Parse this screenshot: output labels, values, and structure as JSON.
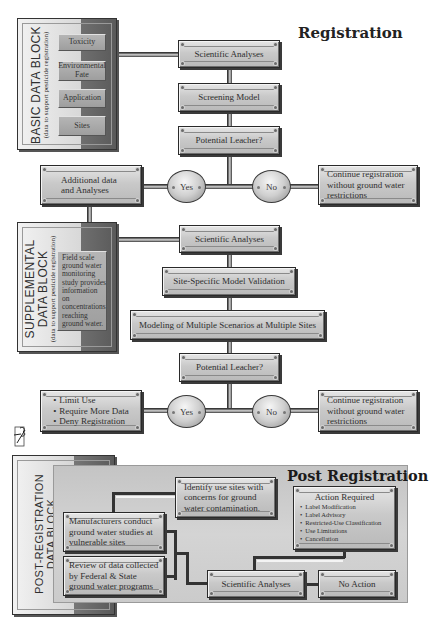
{
  "registration": {
    "title": "Registration",
    "basic_block": {
      "title": "BASIC DATA BLOCK",
      "subtitle": "(data to support pesticide registration)",
      "items": [
        "Toxicity",
        "Environmental Fate",
        "Application",
        "Sites"
      ]
    },
    "flow1": {
      "scientific_analyses": "Scientific Analyses",
      "screening_model": "Screening Model",
      "potential_leacher": "Potential Leacher?",
      "yes": "Yes",
      "no": "No",
      "additional_data": "Additional data and Analyses",
      "continue": "Continue registration without ground water restrictions"
    },
    "supplemental_block": {
      "title_line1": "SUPPLEMENTAL",
      "title_line2": "DATA BLOCK",
      "subtitle": "(data to support pesticide registration)",
      "description": "Field scale ground water monitoring study provides information on concentrations reaching ground water."
    },
    "flow2": {
      "scientific_analyses": "Scientific Analyses",
      "site_specific": "Site-Specific Model Validation",
      "modeling": "Modeling of Multiple Scenarios at Multiple Sites",
      "potential_leacher": "Potential Leacher?",
      "yes": "Yes",
      "no": "No",
      "actions": [
        "Limit Use",
        "Require More Data",
        "Deny Registration"
      ],
      "continue": "Continue registration without ground water restrictions"
    }
  },
  "post_registration": {
    "title": "Post Registration",
    "block_title_line1": "POST-REGISTRATION",
    "block_title_line2": "DATA BLOCK",
    "identify": "Identify use sites with concerns for ground water contamination.",
    "manufacturers": "Manufacturers conduct ground water studies at vulnerable sites",
    "review": "Review of data collected by Federal & State ground water programs",
    "scientific_analyses": "Scientific Analyses",
    "no_action": "No Action",
    "action_required": {
      "title": "Action Required",
      "items": [
        "Label Modification",
        "Label Advisory",
        "Restricted-Use Classification",
        "Use Limitations",
        "Cancellation"
      ]
    }
  },
  "logo": {
    "icon": "signature-logo-icon"
  }
}
